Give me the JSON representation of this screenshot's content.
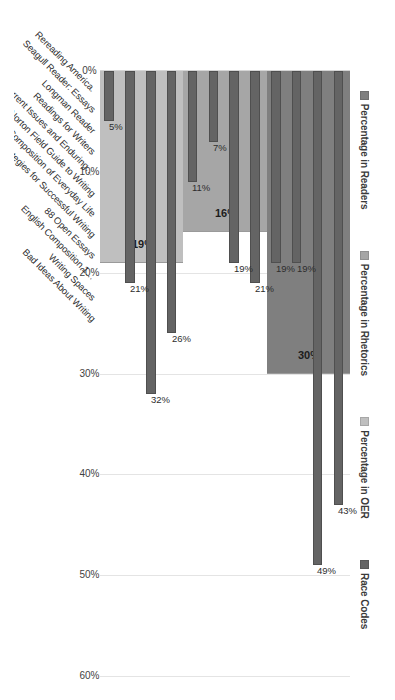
{
  "chart_data": {
    "type": "bar",
    "title": "",
    "xlabel": "",
    "ylabel": "",
    "ylim": [
      0,
      60
    ],
    "grid": true,
    "legend_position": "top",
    "tick_labels": [
      "60%",
      "50%",
      "40%",
      "30%",
      "20%",
      "10%",
      "0%"
    ],
    "tick_values": [
      60,
      50,
      40,
      30,
      20,
      10,
      0
    ],
    "categories": [
      "Rereading America.",
      "Seagull Reader: Essays",
      "Longman Reader",
      "Readings for Writers",
      "Current Issues and Enduring…",
      "Norton Field Guide to Writing",
      "Composition of Everyday Life",
      "Strategies for Successful Writing",
      "88 Open Essays",
      "English Composition 1…",
      "Writing Spaces",
      "Bad Ideas About Writing"
    ],
    "series": [
      {
        "name": "Percentage in Readers",
        "color": "#7f7f7f",
        "type": "group-band",
        "value": 30,
        "value_label": "30%",
        "categories": [
          "Rereading America.",
          "Seagull Reader: Essays",
          "Longman Reader",
          "Readings for Writers"
        ]
      },
      {
        "name": "Percentage in Rhetorics",
        "color": "#a6a6a6",
        "type": "group-band",
        "value": 16,
        "value_label": "16%",
        "categories": [
          "Current Issues and Enduring…",
          "Norton Field Guide to Writing",
          "Composition of Everyday Life",
          "Strategies for Successful Writing"
        ]
      },
      {
        "name": "Percentage in OER",
        "color": "#bfbfbf",
        "type": "group-band",
        "value": 19,
        "value_label": "19%",
        "categories": [
          "88 Open Essays",
          "English Composition 1…",
          "Writing Spaces",
          "Bad Ideas About Writing"
        ]
      },
      {
        "name": "Race Codes",
        "color": "#646464",
        "type": "bars",
        "values": [
          43,
          49,
          19,
          19,
          21,
          19,
          7,
          11,
          26,
          32,
          21,
          5
        ],
        "value_labels": [
          "43%",
          "49%",
          "19%",
          "19%",
          "21%",
          "19%",
          "7%",
          "11%",
          "26%",
          "32%",
          "21%",
          "5%"
        ]
      }
    ],
    "groups": [
      {
        "label": "Percentage in Readers",
        "band_value": 30,
        "band_label": "30%",
        "start_index": 0,
        "count": 4
      },
      {
        "label": "Percentage in Rhetorics",
        "band_value": 16,
        "band_label": "16%",
        "start_index": 4,
        "count": 4
      },
      {
        "label": "Percentage in OER",
        "band_value": 19,
        "band_label": "19%",
        "start_index": 8,
        "count": 4
      }
    ]
  },
  "legend": {
    "items": [
      {
        "label": "Percentage in Readers",
        "color": "#7f7f7f"
      },
      {
        "label": "Percentage in Rhetorics",
        "color": "#a6a6a6"
      },
      {
        "label": "Percentage in OER",
        "color": "#bfbfbf"
      },
      {
        "label": "Race Codes",
        "color": "#646464"
      }
    ]
  }
}
